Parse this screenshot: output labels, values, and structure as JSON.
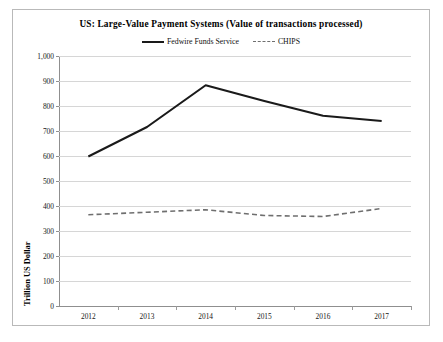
{
  "chart_data": {
    "type": "line",
    "title": "US: Large-Value Payment Systems (Value of transactions processed)",
    "xlabel": "",
    "ylabel": "Trillion US Dollar",
    "x": [
      "2012",
      "2013",
      "2014",
      "2015",
      "2016",
      "2017"
    ],
    "categories": [
      "2012",
      "2013",
      "2014",
      "2015",
      "2016",
      "2017"
    ],
    "series": [
      {
        "name": "Fedwire Funds Service",
        "style": "solid",
        "color": "#1a1a1a",
        "values": [
          598,
          716,
          883,
          820,
          761,
          740
        ]
      },
      {
        "name": "CHIPS",
        "style": "dashed",
        "color": "#6f6f6f",
        "values": [
          365,
          375,
          385,
          362,
          358,
          390
        ]
      }
    ],
    "ylim": [
      0,
      1000
    ],
    "y_ticks": [
      0,
      100,
      200,
      300,
      400,
      500,
      600,
      700,
      800,
      900,
      1000
    ],
    "y_tick_labels": [
      "0",
      "100",
      "200",
      "300",
      "400",
      "500",
      "600",
      "700",
      "800",
      "900",
      "1,000"
    ],
    "grid": true,
    "legend_position": "top-center"
  }
}
